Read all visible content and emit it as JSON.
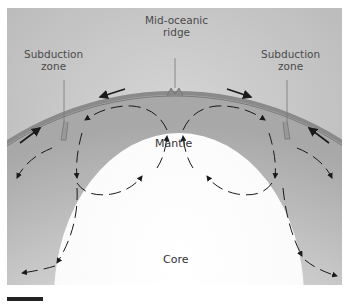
{
  "figure": {
    "labels": {
      "mid_ridge_line1": "Mid-oceanic",
      "mid_ridge_line2": "ridge",
      "subduction_left_line1": "Subduction",
      "subduction_left_line2": "zone",
      "subduction_right_line1": "Subduction",
      "subduction_right_line2": "zone",
      "mantle": "Mantle",
      "core": "Core"
    },
    "colors": {
      "background": "#c8c8c8",
      "crust": "#8a8a8a",
      "arrow": "#1a1a1a",
      "core": "#ffffff"
    }
  }
}
